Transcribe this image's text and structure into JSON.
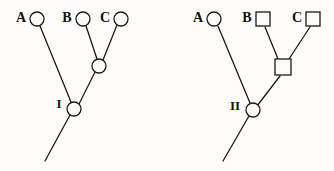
{
  "figure": {
    "width": 334,
    "height": 171,
    "background_color": "#fdfcf8",
    "line_color": "#1a1a1a",
    "node_fill_color": "#fdfcf8"
  },
  "panels": [
    {
      "id": "left-tree",
      "name": "left-phylogenetic-tree",
      "root_label": "I",
      "tips": [
        {
          "label": "A",
          "shape": "circle",
          "cx": 37,
          "cy": 19,
          "r": 7,
          "label_x": 21,
          "label_y": 19
        },
        {
          "label": "B",
          "shape": "circle",
          "cx": 83,
          "cy": 19,
          "r": 7,
          "label_x": 67,
          "label_y": 19
        },
        {
          "label": "C",
          "shape": "circle",
          "cx": 121,
          "cy": 19,
          "r": 7,
          "label_x": 105,
          "label_y": 19
        }
      ],
      "internal_nodes": [
        {
          "label": "",
          "shape": "circle",
          "cx": 99,
          "cy": 66,
          "r": 7
        },
        {
          "label": "I",
          "shape": "circle",
          "cx": 74,
          "cy": 109,
          "r": 7,
          "label_x": 59,
          "label_y": 105
        }
      ],
      "edges": [
        {
          "name": "edge-A-to-I",
          "x1": 40,
          "y1": 26,
          "x2": 71,
          "y2": 102
        },
        {
          "name": "edge-B-to-bc",
          "x1": 86,
          "y1": 26,
          "x2": 97,
          "y2": 59
        },
        {
          "name": "edge-C-to-bc",
          "x1": 117,
          "y1": 25,
          "x2": 103,
          "y2": 60
        },
        {
          "name": "edge-bc-to-I",
          "x1": 95,
          "y1": 72,
          "x2": 79,
          "y2": 104
        },
        {
          "name": "edge-I-stem",
          "x1": 70,
          "y1": 115,
          "x2": 45,
          "y2": 161
        }
      ]
    },
    {
      "id": "right-tree",
      "name": "right-phylogenetic-tree",
      "root_label": "II",
      "tips": [
        {
          "label": "A",
          "shape": "circle",
          "cx": 214,
          "cy": 19,
          "r": 7,
          "label_x": 198,
          "label_y": 19
        },
        {
          "label": "B",
          "shape": "square",
          "cx": 263,
          "cy": 19,
          "size": 14,
          "label_x": 247,
          "label_y": 19
        },
        {
          "label": "C",
          "shape": "square",
          "cx": 313,
          "cy": 19,
          "size": 14,
          "label_x": 297,
          "label_y": 19
        }
      ],
      "internal_nodes": [
        {
          "label": "",
          "shape": "square",
          "cx": 283,
          "cy": 67,
          "size": 16
        },
        {
          "label": "II",
          "shape": "circle",
          "cx": 253,
          "cy": 110,
          "r": 7,
          "label_x": 235,
          "label_y": 107
        }
      ],
      "edges": [
        {
          "name": "edge-A-to-II",
          "x1": 218,
          "y1": 26,
          "x2": 250,
          "y2": 103
        },
        {
          "name": "edge-B-to-bc",
          "x1": 265,
          "y1": 27,
          "x2": 278,
          "y2": 59
        },
        {
          "name": "edge-C-to-bc",
          "x1": 310,
          "y1": 27,
          "x2": 289,
          "y2": 59
        },
        {
          "name": "edge-bc-to-II",
          "x1": 280,
          "y1": 76,
          "x2": 257,
          "y2": 106
        },
        {
          "name": "edge-II-stem",
          "x1": 249,
          "y1": 116,
          "x2": 223,
          "y2": 161
        }
      ]
    }
  ]
}
